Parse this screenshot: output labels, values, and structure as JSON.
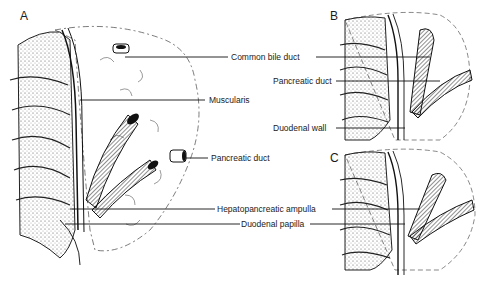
{
  "figure": {
    "panels": [
      {
        "id": "A",
        "letter": "A"
      },
      {
        "id": "B",
        "letter": "B"
      },
      {
        "id": "C",
        "letter": "C"
      }
    ],
    "labels": {
      "common_bile_duct": "Common bile duct",
      "muscularis": "Muscularis",
      "pancreatic_duct_a": "Pancreatic duct",
      "pancreatic_duct_b": "Pancreatic duct",
      "duodenal_wall": "Duodenal wall",
      "hepatopancreatic_ampulla": "Hepatopancreatic ampulla",
      "duodenal_papilla": "Duodenal papilla"
    },
    "colors": {
      "ink": "#1a1a1a",
      "background": "#ffffff"
    }
  }
}
